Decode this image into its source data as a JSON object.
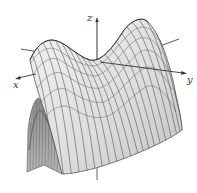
{
  "figure": {
    "type": "3d-surface",
    "axes": {
      "x_label": "x",
      "y_label": "y",
      "z_label": "z"
    },
    "colors": {
      "surface_fill": "#dcdcdc",
      "surface_shade": "#9a9a9a",
      "mesh_line": "#4a4a4a",
      "axis": "#333333",
      "background": "#ffffff"
    }
  }
}
